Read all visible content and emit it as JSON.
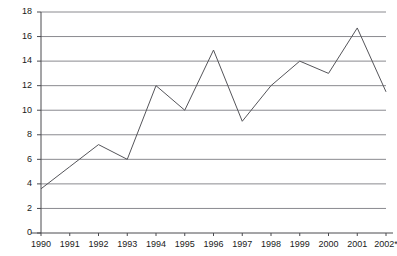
{
  "chart_data": {
    "type": "line",
    "title": "",
    "subtitle": "",
    "xlabel": "",
    "ylabel": "",
    "categories": [
      "1990",
      "1991",
      "1992",
      "1993",
      "1994",
      "1995",
      "1996",
      "1997",
      "1998",
      "1999",
      "2000",
      "2001",
      "2002*"
    ],
    "values": [
      3.6,
      5.4,
      7.2,
      6.0,
      12.0,
      10.0,
      14.9,
      9.1,
      12.0,
      14.0,
      13.0,
      16.7,
      11.5
    ],
    "ylim": [
      0,
      18
    ],
    "ytick_values": [
      0,
      2,
      4,
      6,
      8,
      10,
      12,
      14,
      16,
      18
    ],
    "ytick_labels": [
      "0",
      "2",
      "4",
      "6",
      "8",
      "10",
      "12",
      "14",
      "16",
      "18"
    ],
    "grid": true,
    "grid_axis": "y",
    "legend": false,
    "legend_position": "none",
    "markers": false,
    "series": [
      {
        "name": "",
        "values": [
          3.6,
          5.4,
          7.2,
          6.0,
          12.0,
          10.0,
          14.9,
          9.1,
          12.0,
          14.0,
          13.0,
          16.7,
          11.5
        ]
      }
    ],
    "annotations": [],
    "footnote": "",
    "colors": {
      "line": "#55555a",
      "grid": "#8a8a8f",
      "axis": "#4a4a4f",
      "text": "#1a1a1a",
      "background": "#ffffff"
    }
  }
}
